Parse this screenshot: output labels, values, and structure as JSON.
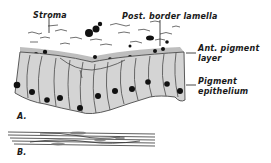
{
  "figure": {
    "labels": {
      "stroma": "Stroma",
      "post_border_lamella": "Post. border lamella",
      "ant_pigment_layer_line1": "Ant. pigment",
      "ant_pigment_layer_line2": "layer",
      "pigment_epithelium_line1": "Pigment",
      "pigment_epithelium_line2": "epithelium"
    },
    "panels": {
      "a": "A.",
      "b": "B."
    },
    "colors": {
      "ink": "#1a1a1a",
      "cell_fill": "#d4d4d4",
      "cell_border": "#4a4a4a",
      "nucleus": "#111111",
      "background": "#ffffff"
    }
  }
}
